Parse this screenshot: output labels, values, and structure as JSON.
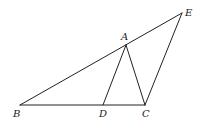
{
  "diagram": {
    "type": "geometry",
    "stroke_color": "#222222",
    "background": "#ffffff",
    "points": {
      "A": {
        "label": "A",
        "x": 126,
        "y": 45,
        "lx": 121,
        "ly": 40
      },
      "B": {
        "label": "B",
        "x": 20,
        "y": 105,
        "lx": 13,
        "ly": 117
      },
      "C": {
        "label": "C",
        "x": 145,
        "y": 105,
        "lx": 142,
        "ly": 117
      },
      "D": {
        "label": "D",
        "x": 103,
        "y": 105,
        "lx": 99,
        "ly": 117
      },
      "E": {
        "label": "E",
        "x": 182,
        "y": 13,
        "lx": 185,
        "ly": 16
      }
    },
    "segments": [
      {
        "from": "B",
        "to": "E",
        "name": "segment-BE"
      },
      {
        "from": "B",
        "to": "C",
        "name": "segment-BC"
      },
      {
        "from": "A",
        "to": "D",
        "name": "segment-AD"
      },
      {
        "from": "A",
        "to": "C",
        "name": "segment-AC"
      },
      {
        "from": "C",
        "to": "E",
        "name": "segment-CE"
      }
    ]
  }
}
